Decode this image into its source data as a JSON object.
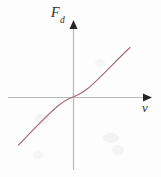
{
  "figure": {
    "name": "drag-force-vs-velocity-plot",
    "background_color": "#fdfdfd",
    "width": 161,
    "height": 177
  },
  "axes": {
    "color": "#b9b9b9",
    "arrow_color": "#262626",
    "x_axis": {
      "label": "v",
      "label_text": "v",
      "origin_px": 73,
      "start_px": 8,
      "end_px": 150,
      "arrow": "right-arrow"
    },
    "y_axis": {
      "label_main": "F",
      "label_sub": "d",
      "label_text": "Fd",
      "origin_px": 97,
      "start_px": 170,
      "end_px": 22,
      "arrow": "up-arrow"
    }
  },
  "chart_data": {
    "type": "line",
    "title": "",
    "subtitle": "",
    "xlabel": "v",
    "ylabel": "Fd",
    "grid": false,
    "legend": null,
    "annotations": [],
    "xlim": [
      -1.0,
      1.25
    ],
    "ylim": [
      -1.0,
      1.25
    ],
    "xticks": [],
    "yticks": [],
    "series": [
      {
        "name": "drag force",
        "color": "#9e6b72",
        "relation": "odd cubic-like: Fd increases monotonically with v, passing through the origin",
        "x": [
          -1.0,
          -0.95,
          -0.9,
          -0.85,
          -0.8,
          -0.75,
          -0.7,
          -0.65,
          -0.6,
          -0.55,
          -0.5,
          -0.45,
          -0.4,
          -0.35,
          -0.3,
          -0.25,
          -0.2,
          -0.15,
          -0.1,
          -0.05,
          0.0,
          0.05,
          0.1,
          0.15,
          0.2,
          0.25,
          0.3,
          0.35,
          0.4,
          0.45,
          0.5,
          0.55,
          0.6,
          0.65,
          0.7,
          0.75,
          0.8,
          0.85,
          0.9,
          0.95,
          1.0,
          1.05,
          1.1,
          1.15
        ],
        "y": [
          -0.74,
          -0.69,
          -0.64,
          -0.6,
          -0.55,
          -0.51,
          -0.47,
          -0.43,
          -0.39,
          -0.35,
          -0.31,
          -0.27,
          -0.24,
          -0.2,
          -0.17,
          -0.14,
          -0.11,
          -0.08,
          -0.05,
          -0.03,
          0.0,
          0.03,
          0.05,
          0.08,
          0.11,
          0.14,
          0.17,
          0.2,
          0.24,
          0.27,
          0.31,
          0.35,
          0.39,
          0.43,
          0.47,
          0.51,
          0.55,
          0.6,
          0.64,
          0.69,
          0.74,
          0.79,
          0.84,
          0.89
        ]
      }
    ]
  },
  "curve": {
    "color": "#9e6b72",
    "stroke_width": 1.1,
    "path": "M 18.5 145 C 34 129 48 114 58.5 105.5 C 65 100.3 69.5 98.2 73 97 C 76.5 95.8 81 93.8 87.5 88.8 C 98 80.5 114 62.5 130 47.5"
  },
  "smudges": [
    {
      "left": 36,
      "top": 115,
      "width": 13,
      "height": 9,
      "color": "#f4f2f3"
    },
    {
      "left": 104,
      "top": 133,
      "width": 14,
      "height": 10,
      "color": "#f4f2f3"
    },
    {
      "left": 112,
      "top": 146,
      "width": 12,
      "height": 9,
      "color": "#f5f3f4"
    },
    {
      "left": 33,
      "top": 152,
      "width": 10,
      "height": 7,
      "color": "#f6f5f5"
    },
    {
      "left": 96,
      "top": 60,
      "width": 9,
      "height": 7,
      "color": "#f7f6f6"
    }
  ]
}
